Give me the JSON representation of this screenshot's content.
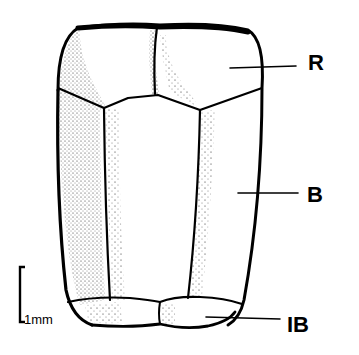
{
  "figure": {
    "labels": {
      "r": "R",
      "b": "B",
      "ib": "IB"
    },
    "scale_bar": {
      "label": "1mm"
    },
    "colors": {
      "ink": "#000000",
      "background": "#ffffff"
    }
  }
}
